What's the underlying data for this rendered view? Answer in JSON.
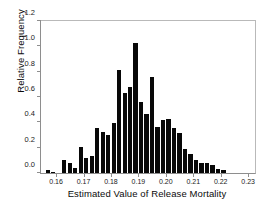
{
  "chart_data": {
    "type": "bar",
    "title": "",
    "xlabel": "Estimated Value of Release Mortality",
    "ylabel": "Relative Frequency",
    "ylim": [
      0.0,
      1.2
    ],
    "xlim": [
      0.1545,
      0.2325
    ],
    "grid": false,
    "legend": null,
    "ytick_labels": [
      "0.0",
      "0.2",
      "0.4",
      "0.6",
      "0.8",
      "1.0",
      "1.2"
    ],
    "ytick_values": [
      0.0,
      0.2,
      0.4,
      0.6,
      0.8,
      1.0,
      1.2
    ],
    "xtick_labels": [
      "0.16",
      "0.17",
      "0.18",
      "0.19",
      "0.20",
      "0.21",
      "0.22",
      "0.23"
    ],
    "xtick_values": [
      0.16,
      0.17,
      0.18,
      0.19,
      0.2,
      0.21,
      0.22,
      0.23
    ],
    "bar_color": "#080808",
    "bin_width": 0.002,
    "categories": [
      "0.1570",
      "0.1590",
      "0.1610",
      "0.1630",
      "0.1650",
      "0.1670",
      "0.1690",
      "0.1710",
      "0.1730",
      "0.1750",
      "0.1770",
      "0.1790",
      "0.1810",
      "0.1830",
      "0.1850",
      "0.1870",
      "0.1890",
      "0.1910",
      "0.1930",
      "0.1950",
      "0.1970",
      "0.1990",
      "0.2010",
      "0.2030",
      "0.2050",
      "0.2070",
      "0.2090",
      "0.2110",
      "0.2130",
      "0.2150",
      "0.2170",
      "0.2190",
      "0.2210",
      "0.2230",
      "0.2250",
      "0.2270",
      "0.2290"
    ],
    "values": [
      0.02,
      0.01,
      0.0,
      0.1,
      0.08,
      0.04,
      0.2,
      0.12,
      0.13,
      0.35,
      0.32,
      0.3,
      0.39,
      0.8,
      0.62,
      0.67,
      1.01,
      0.55,
      0.46,
      0.75,
      0.36,
      0.41,
      0.42,
      0.35,
      0.31,
      0.19,
      0.15,
      0.1,
      0.08,
      0.08,
      0.06,
      0.03,
      0.02,
      0.0,
      0.0,
      0.0,
      0.0
    ]
  }
}
